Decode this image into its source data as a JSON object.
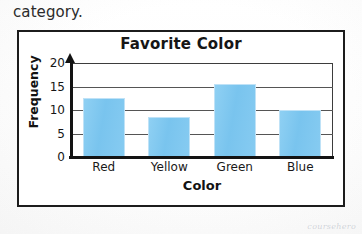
{
  "document": {
    "prose_line": "category.",
    "watermark": "coursehero"
  },
  "chart_data": {
    "type": "bar",
    "title": "Favorite Color",
    "xlabel": "Color",
    "ylabel": "Frequency",
    "categories": [
      "Red",
      "Yellow",
      "Green",
      "Blue"
    ],
    "values": [
      12.5,
      8.5,
      15.5,
      10
    ],
    "yticks": [
      20,
      15,
      10,
      5,
      0
    ],
    "ylim": [
      0,
      20
    ],
    "grid": true,
    "legend": "none",
    "bar_color": "#7fc8ef",
    "axis_color": "#131313"
  }
}
